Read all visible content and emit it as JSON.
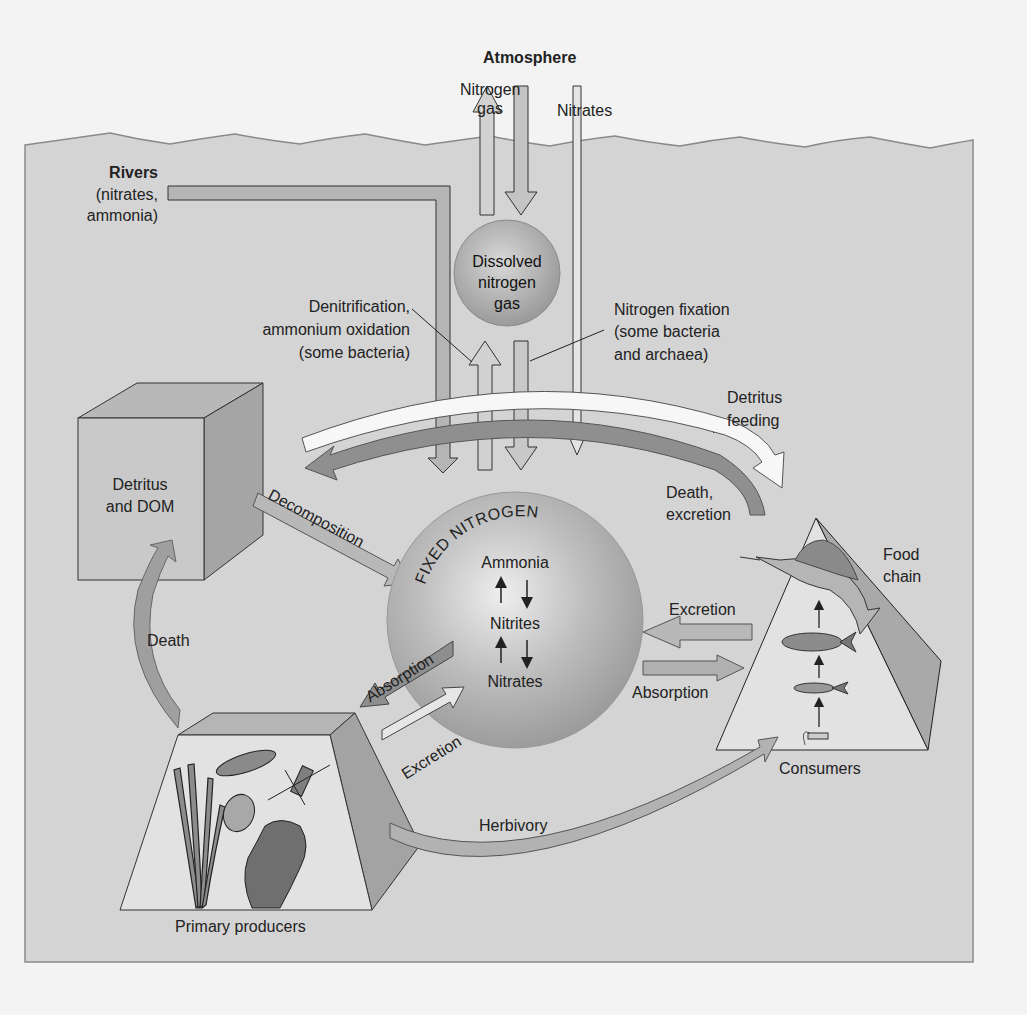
{
  "diagram": {
    "title": "Atmosphere",
    "colors": {
      "background": "#f3f3f3",
      "water": "#d4d4d4",
      "water_outline": "#8a8a8a",
      "arrow_light": "#c8c8c8",
      "arrow_mid": "#a8a8a8",
      "arrow_dark": "#8e8e8e",
      "arrow_white": "#f7f7f7",
      "sphere": "#b0b0b0",
      "box_front": "#c9c9c9",
      "box_side": "#a9a9a9",
      "pyramid_face": "#e2e2e2"
    },
    "atmosphere": {
      "label": "Atmosphere",
      "nitrogen_gas_line1": "Nitrogen",
      "nitrogen_gas_line2": "gas",
      "nitrates": "Nitrates"
    },
    "rivers": {
      "title": "Rivers",
      "line1": "(nitrates,",
      "line2": "ammonia)"
    },
    "dissolved_gas": {
      "line1": "Dissolved",
      "line2": "nitrogen",
      "line3": "gas"
    },
    "denitrification": {
      "line1": "Denitrification,",
      "line2": "ammonium oxidation",
      "line3": "(some bacteria)"
    },
    "fixation": {
      "line1": "Nitrogen fixation",
      "line2": "(some bacteria",
      "line3": "and archaea)"
    },
    "detritus_feeding": {
      "line1": "Detritus",
      "line2": "feeding"
    },
    "detritus_box": {
      "line1": "Detritus",
      "line2": "and DOM"
    },
    "fixed_nitrogen": {
      "title": "FIXED NITROGEN",
      "ammonia": "Ammonia",
      "nitrites": "Nitrites",
      "nitrates": "Nitrates"
    },
    "flows": {
      "decomposition": "Decomposition",
      "death": "Death",
      "death_excretion_line1": "Death,",
      "death_excretion_line2": "excretion",
      "absorption_producers": "Absorption",
      "excretion_producers": "Excretion",
      "excretion_consumers": "Excretion",
      "absorption_consumers": "Absorption",
      "herbivory": "Herbivory"
    },
    "consumers": {
      "label": "Consumers",
      "food_chain_line1": "Food",
      "food_chain_line2": "chain"
    },
    "producers": {
      "label": "Primary producers"
    }
  }
}
